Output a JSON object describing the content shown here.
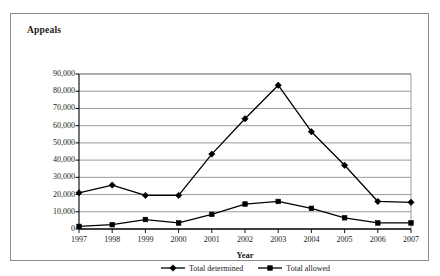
{
  "chart_data": {
    "type": "line",
    "title": "Appeals",
    "subtitle": "",
    "xlabel": "Year",
    "ylabel": "",
    "categories": [
      "1997",
      "1998",
      "1999",
      "2000",
      "2001",
      "2002",
      "2003",
      "2004",
      "2005",
      "2006",
      "2007"
    ],
    "series": [
      {
        "name": "Total determined",
        "marker": "diamond",
        "color": "#000000",
        "values": [
          21000,
          25500,
          19500,
          19500,
          43500,
          64000,
          83500,
          56500,
          37000,
          16000,
          15500
        ]
      },
      {
        "name": "Total allowed",
        "marker": "square",
        "color": "#000000",
        "values": [
          1500,
          2500,
          5500,
          3500,
          8500,
          14500,
          16000,
          12000,
          6500,
          3500,
          3500
        ]
      }
    ],
    "ylim": [
      0,
      90000
    ],
    "ytick_values": [
      0,
      10000,
      20000,
      30000,
      40000,
      50000,
      60000,
      70000,
      80000,
      90000
    ],
    "ytick_labels": [
      "0",
      "10,000",
      "20,000",
      "30,000",
      "40,000",
      "50,000",
      "60,000",
      "70,000",
      "80,000",
      "90,000"
    ],
    "grid": "horizontal",
    "legend_position": "bottom",
    "legend": [
      "Total determined",
      "Total allowed"
    ],
    "annotations": [],
    "colors": {
      "gridline": "#808080",
      "axis": "#000000",
      "series_line": "#000000",
      "frame": "#8c8c8c",
      "background": "#ffffff"
    }
  }
}
